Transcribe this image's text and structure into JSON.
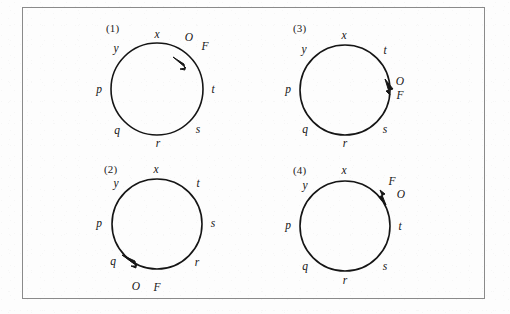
{
  "figure": {
    "background_color": "#fdfdfd",
    "frame_color": "#8a8a8a",
    "stroke_color": "#151515"
  },
  "panels": [
    {
      "id": "panel-1",
      "number": "(1)",
      "circle": {
        "cx": 157,
        "cy": 89,
        "r": 46
      },
      "arrow": {
        "position_deg": 52,
        "direction": "clockwise",
        "description": "arrow on upper-right arc pointing clockwise (down-right)"
      },
      "labels": [
        {
          "name": "x",
          "text": "x",
          "x": 157,
          "y": 35
        },
        {
          "name": "y",
          "text": "y",
          "x": 116,
          "y": 49
        },
        {
          "name": "p",
          "text": "p",
          "x": 99,
          "y": 90
        },
        {
          "name": "q",
          "text": "q",
          "x": 117,
          "y": 131
        },
        {
          "name": "r",
          "text": "r",
          "x": 158,
          "y": 144
        },
        {
          "name": "s",
          "text": "s",
          "x": 198,
          "y": 130
        },
        {
          "name": "t",
          "text": "t",
          "x": 213,
          "y": 90
        },
        {
          "name": "O",
          "text": "O",
          "x": 189,
          "y": 38
        },
        {
          "name": "F",
          "text": "F",
          "x": 205,
          "y": 47
        }
      ]
    },
    {
      "id": "panel-2",
      "number": "(2)",
      "circle": {
        "cx": 157,
        "cy": 224,
        "r": 45
      },
      "arrow": {
        "position_deg": 237,
        "direction": "counterclockwise",
        "description": "arrow on lower-left arc pointing counterclockwise (down-right along bottom)"
      },
      "labels": [
        {
          "name": "x",
          "text": "x",
          "x": 156,
          "y": 170
        },
        {
          "name": "y",
          "text": "y",
          "x": 116,
          "y": 184
        },
        {
          "name": "p",
          "text": "p",
          "x": 99,
          "y": 224
        },
        {
          "name": "q",
          "text": "q",
          "x": 113,
          "y": 262
        },
        {
          "name": "O",
          "text": "O",
          "x": 136,
          "y": 287
        },
        {
          "name": "F",
          "text": "F",
          "x": 157,
          "y": 288
        },
        {
          "name": "r",
          "text": "r",
          "x": 197,
          "y": 263
        },
        {
          "name": "s",
          "text": "s",
          "x": 213,
          "y": 224
        },
        {
          "name": "t",
          "text": "t",
          "x": 198,
          "y": 184
        }
      ]
    },
    {
      "id": "panel-3",
      "number": "(3)",
      "circle": {
        "cx": 345,
        "cy": 90,
        "r": 45
      },
      "arrow": {
        "position_deg": 352,
        "direction": "clockwise",
        "description": "arrow on right arc pointing downward (clockwise)"
      },
      "labels": [
        {
          "name": "x",
          "text": "x",
          "x": 344,
          "y": 36
        },
        {
          "name": "y",
          "text": "y",
          "x": 304,
          "y": 50
        },
        {
          "name": "p",
          "text": "p",
          "x": 288,
          "y": 90
        },
        {
          "name": "q",
          "text": "q",
          "x": 305,
          "y": 130
        },
        {
          "name": "r",
          "text": "r",
          "x": 345,
          "y": 144
        },
        {
          "name": "s",
          "text": "s",
          "x": 385,
          "y": 130
        },
        {
          "name": "O",
          "text": "O",
          "x": 400,
          "y": 82
        },
        {
          "name": "F",
          "text": "F",
          "x": 400,
          "y": 96
        },
        {
          "name": "t",
          "text": "t",
          "x": 385,
          "y": 51
        }
      ]
    },
    {
      "id": "panel-4",
      "number": "(4)",
      "circle": {
        "cx": 345,
        "cy": 226,
        "r": 45
      },
      "arrow": {
        "position_deg": 55,
        "direction": "counterclockwise",
        "description": "arrow on upper-right arc pointing up-left (counterclockwise)"
      },
      "labels": [
        {
          "name": "x",
          "text": "x",
          "x": 344,
          "y": 171
        },
        {
          "name": "y",
          "text": "y",
          "x": 305,
          "y": 186
        },
        {
          "name": "p",
          "text": "p",
          "x": 288,
          "y": 226
        },
        {
          "name": "q",
          "text": "q",
          "x": 305,
          "y": 267
        },
        {
          "name": "r",
          "text": "r",
          "x": 345,
          "y": 281
        },
        {
          "name": "s",
          "text": "s",
          "x": 385,
          "y": 267
        },
        {
          "name": "t",
          "text": "t",
          "x": 400,
          "y": 227
        },
        {
          "name": "F",
          "text": "F",
          "x": 392,
          "y": 182
        },
        {
          "name": "O",
          "text": "O",
          "x": 401,
          "y": 195
        }
      ]
    }
  ],
  "panel_number_positions": [
    {
      "id": "panel-1",
      "x": 106,
      "y": 22
    },
    {
      "id": "panel-2",
      "x": 104,
      "y": 163
    },
    {
      "id": "panel-3",
      "x": 293,
      "y": 22
    },
    {
      "id": "panel-4",
      "x": 293,
      "y": 164
    }
  ]
}
